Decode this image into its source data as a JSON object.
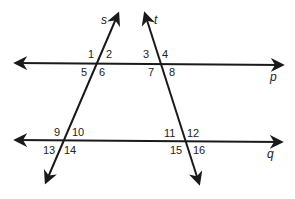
{
  "diagram": {
    "type": "parallel-lines-cut-by-transversals",
    "lines": {
      "p": {
        "label": "p",
        "kind": "horizontal"
      },
      "q": {
        "label": "q",
        "kind": "horizontal"
      },
      "s": {
        "label": "s",
        "kind": "transversal"
      },
      "t": {
        "label": "t",
        "kind": "transversal"
      }
    },
    "angles": {
      "a1": "1",
      "a2": "2",
      "a3": "3",
      "a4": "4",
      "a5": "5",
      "a6": "6",
      "a7": "7",
      "a8": "8",
      "a9": "9",
      "a10": "10",
      "a11": "11",
      "a12": "12",
      "a13": "13",
      "a14": "14",
      "a15": "15",
      "a16": "16"
    },
    "intersections": [
      {
        "lines": [
          "s",
          "p"
        ],
        "angles": [
          "1",
          "2",
          "5",
          "6"
        ]
      },
      {
        "lines": [
          "t",
          "p"
        ],
        "angles": [
          "3",
          "4",
          "7",
          "8"
        ]
      },
      {
        "lines": [
          "s",
          "q"
        ],
        "angles": [
          "9",
          "10",
          "13",
          "14"
        ]
      },
      {
        "lines": [
          "t",
          "q"
        ],
        "angles": [
          "11",
          "12",
          "15",
          "16"
        ]
      }
    ],
    "colors": {
      "stroke": "#1a1a1a",
      "background": "#ffffff"
    }
  }
}
